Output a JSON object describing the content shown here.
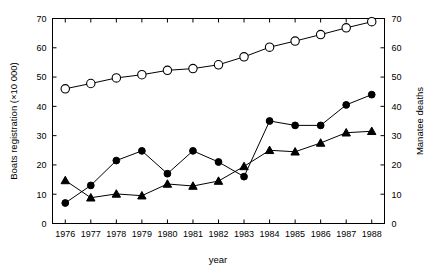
{
  "chart_data": {
    "type": "line",
    "title": "",
    "subtitle": "",
    "xlabel": "year",
    "ylabel": "Boats registration  (×10 000)",
    "ylabel_right": "Manatee deaths",
    "x": [
      1976,
      1977,
      1978,
      1979,
      1980,
      1981,
      1982,
      1983,
      1984,
      1985,
      1986,
      1987,
      1988
    ],
    "categories": [
      "1976",
      "1977",
      "1978",
      "1979",
      "1980",
      "1981",
      "1982",
      "1983",
      "1984",
      "1985",
      "1986",
      "1987",
      "1988"
    ],
    "xlim": [
      1975.5,
      1988.5
    ],
    "ylim": [
      0,
      70
    ],
    "ylim_right": [
      0,
      70
    ],
    "yticks": [
      0,
      10,
      20,
      30,
      40,
      50,
      60,
      70
    ],
    "yticks_right": [
      0,
      10,
      20,
      30,
      40,
      50,
      60,
      70
    ],
    "grid": false,
    "legend": "none",
    "legend_position": "none",
    "series": [
      {
        "name": "Boats registration (×10 000)",
        "axis": "left",
        "marker": "open-circle",
        "values": [
          46.0,
          47.8,
          49.7,
          50.8,
          52.3,
          52.9,
          54.2,
          56.9,
          60.2,
          62.3,
          64.5,
          66.8,
          68.9
        ]
      },
      {
        "name": "Manatee deaths (boat-related)",
        "axis": "right",
        "marker": "filled-circle",
        "values": [
          7,
          13,
          21.5,
          24.8,
          17,
          24.8,
          21,
          16,
          35,
          33.5,
          33.5,
          40.5,
          44
        ]
      },
      {
        "name": "Manatee deaths (other)",
        "axis": "right",
        "marker": "filled-triangle",
        "values": [
          14.7,
          8.8,
          10.1,
          9.5,
          13.5,
          12.8,
          14.5,
          19.5,
          25,
          24.5,
          27.5,
          31,
          31.5
        ]
      }
    ]
  },
  "axes": {
    "x_tick_labels": [
      "1976",
      "1977",
      "1978",
      "1979",
      "1980",
      "1981",
      "1982",
      "1983",
      "1984",
      "1985",
      "1986",
      "1987",
      "1988"
    ],
    "y_tick_labels_left": [
      "0",
      "10",
      "20",
      "30",
      "40",
      "50",
      "60",
      "70"
    ],
    "y_tick_labels_right": [
      "0",
      "10",
      "20",
      "30",
      "40",
      "50",
      "60",
      "70"
    ],
    "xlabel": "year",
    "ylabel_left": "Boats registration  (×10 000)",
    "ylabel_right": "Manatee deaths"
  },
  "colors": {
    "axis": "#000000",
    "line": "#000000",
    "marker_open_fill": "#ffffff",
    "marker_filled": "#000000",
    "background": "#ffffff"
  }
}
